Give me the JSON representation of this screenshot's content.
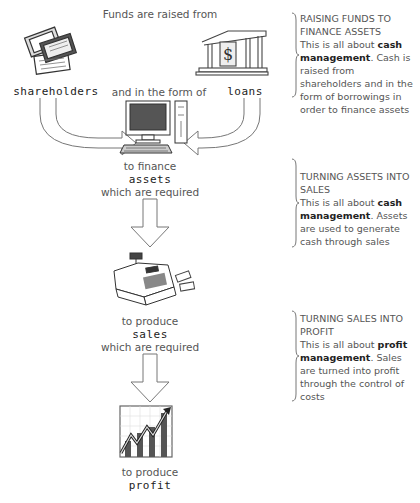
{
  "flow": {
    "top_label": "Funds are raised from",
    "source_left": "shareholders",
    "middle_label": "and in the form of",
    "source_right": "loans",
    "step1": {
      "prefix": "to finance",
      "keyword": "assets",
      "suffix": "which are required"
    },
    "step2": {
      "prefix": "to produce",
      "keyword": "sales",
      "suffix": "which are required"
    },
    "step3": {
      "prefix": "to produce",
      "keyword": "profit"
    }
  },
  "icons": {
    "shareholders": "share-certificates-icon",
    "loans": "bank-building-icon",
    "assets": "desktop-computer-icon",
    "sales": "cash-register-icon",
    "profit": "rising-bar-chart-icon"
  },
  "notes": [
    {
      "heading": "RAISING FUNDS TO FINANCE ASSETS",
      "lead": "This is all about ",
      "bold": "cash management",
      "rest": ". Cash is raised from shareholders and in the form of borrowings in order to finance assets"
    },
    {
      "heading": "TURNING ASSETS INTO SALES",
      "lead": "This is all about ",
      "bold": "cash management",
      "rest": ". Assets are used to generate cash through sales"
    },
    {
      "heading": "TURNING SALES INTO PROFIT",
      "lead": "This is all about ",
      "bold": "profit management",
      "rest": ". Sales are turned into profit through the control of costs"
    }
  ]
}
